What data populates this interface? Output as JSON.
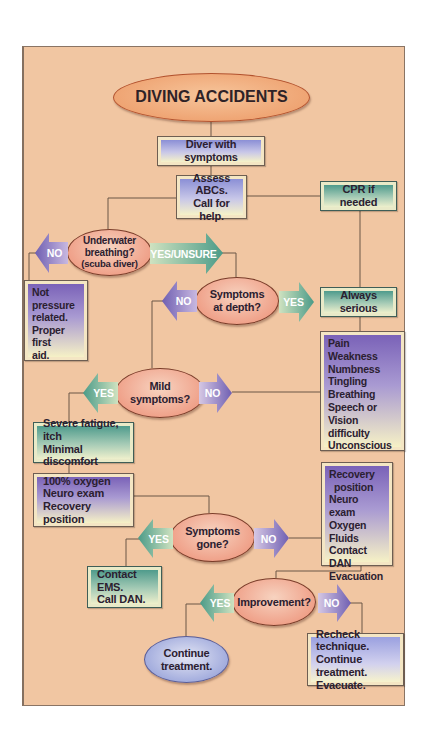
{
  "title": "DIVING ACCIDENTS",
  "colors": {
    "panel_bg": "#f1c6a2",
    "line": "#6a5646",
    "decision_fill": "#ef9e86",
    "teal_arrow": "#4f9b8c",
    "purple_arrow": "#7a62b8"
  },
  "nodes": {
    "diver_with_symptoms": "Diver with symptoms",
    "assess_abcs": [
      "Assess ABCs.",
      "Call for help."
    ],
    "cpr_if_needed": "CPR if needed",
    "underwater_breathing": [
      "Underwater",
      "breathing?",
      "(scuba diver)"
    ],
    "not_pressure_related": [
      "Not",
      "pressure",
      "related.",
      "Proper first",
      "aid."
    ],
    "symptoms_at_depth": [
      "Symptoms",
      "at depth?"
    ],
    "always_serious": "Always serious",
    "serious_symptoms": [
      "Pain",
      "Weakness",
      "Numbness",
      "Tingling",
      "Breathing",
      "Speech or",
      "Vision difficulty",
      "Unconscious"
    ],
    "mild_symptoms": [
      "Mild",
      "symptoms?"
    ],
    "severe_fatigue": [
      "Severe fatigue, itch",
      "Minimal discomfort"
    ],
    "first_aid_mild": [
      "100% oxygen",
      "Neuro exam",
      "Recovery position"
    ],
    "symptoms_gone": [
      "Symptoms",
      "gone?"
    ],
    "serious_first_aid": [
      "Recovery",
      "position",
      "Neuro exam",
      "Oxygen",
      "Fluids",
      "Contact DAN",
      "Evacuation"
    ],
    "contact_ems": [
      "Contact EMS.",
      "Call DAN."
    ],
    "improvement": "Improvement?",
    "continue_treatment": [
      "Continue",
      "treatment."
    ],
    "recheck": [
      "Recheck technique.",
      "Continue treatment.",
      "Evacuate."
    ]
  },
  "arrows": {
    "breathing_no": "NO",
    "breathing_yes": "YES/UNSURE",
    "depth_no": "NO",
    "depth_yes": "YES",
    "mild_yes": "YES",
    "mild_no": "NO",
    "gone_yes": "YES",
    "gone_no": "NO",
    "improvement_yes": "YES",
    "improvement_no": "NO"
  }
}
